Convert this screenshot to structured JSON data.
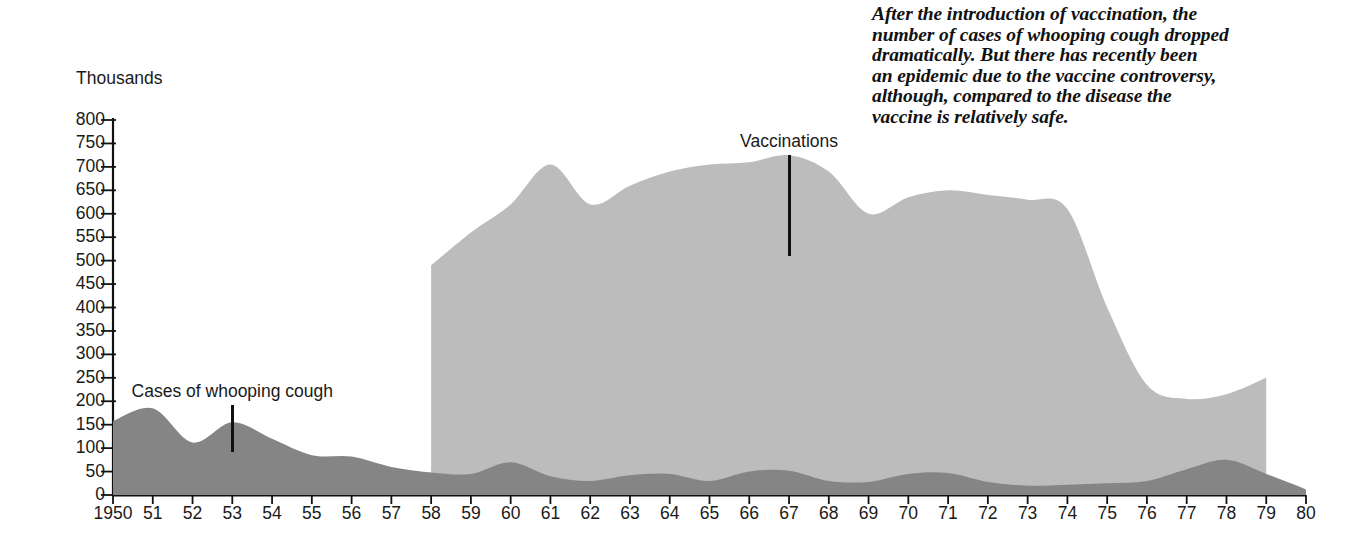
{
  "annotation": {
    "name": "editorial-note",
    "lines": [
      "After the introduction of vaccination, the",
      "number of cases of whooping cough dropped",
      "dramatically. But there has recently been",
      "an epidemic due to the vaccine controversy,",
      "although, compared to the disease the",
      "vaccine is relatively safe."
    ]
  },
  "colors": {
    "cases_fill": "#858585",
    "vaccinations_fill": "#bcbcbc",
    "axis": "#111111",
    "text": "#1a1a1a"
  },
  "chart_data": {
    "type": "area",
    "title": "",
    "subtitle": "",
    "xlabel": "",
    "ylabel": "Thousands",
    "grid": false,
    "legend_position": "inline-annotations",
    "xlim": [
      1950,
      1980
    ],
    "ylim": [
      0,
      800
    ],
    "ytick_step": 50,
    "x": [
      1950,
      1951,
      1952,
      1953,
      1954,
      1955,
      1956,
      1957,
      1958,
      1959,
      1960,
      1961,
      1962,
      1963,
      1964,
      1965,
      1966,
      1967,
      1968,
      1969,
      1970,
      1971,
      1972,
      1973,
      1974,
      1975,
      1976,
      1977,
      1978,
      1979,
      1980
    ],
    "xticklabels": [
      "1950",
      "51",
      "52",
      "53",
      "54",
      "55",
      "56",
      "57",
      "58",
      "59",
      "60",
      "61",
      "62",
      "63",
      "64",
      "65",
      "66",
      "67",
      "68",
      "69",
      "70",
      "71",
      "72",
      "73",
      "74",
      "75",
      "76",
      "77",
      "78",
      "79",
      "80"
    ],
    "yticklabels": [
      "800",
      "750",
      "700",
      "650",
      "600",
      "550",
      "500",
      "450",
      "400",
      "350",
      "300",
      "250",
      "200",
      "150",
      "100",
      "50",
      "0"
    ],
    "yticks": [
      800,
      750,
      700,
      650,
      600,
      550,
      500,
      450,
      400,
      350,
      300,
      250,
      200,
      150,
      100,
      50,
      0
    ],
    "series": [
      {
        "name": "Cases of whooping cough",
        "fill": "#858585",
        "label_x": 1953,
        "label_text": "Cases of whooping cough",
        "values": [
          158,
          185,
          112,
          155,
          120,
          85,
          82,
          60,
          48,
          45,
          70,
          40,
          30,
          42,
          45,
          30,
          50,
          52,
          30,
          28,
          45,
          47,
          28,
          20,
          22,
          25,
          30,
          55,
          75,
          45,
          12
        ]
      },
      {
        "name": "Vaccinations",
        "fill": "#bcbcbc",
        "label_x": 1967,
        "label_text": "Vaccinations",
        "start_year": 1958,
        "end_year": 1979,
        "values": [
          null,
          null,
          null,
          null,
          null,
          null,
          null,
          null,
          490,
          560,
          620,
          705,
          620,
          660,
          690,
          705,
          710,
          725,
          690,
          600,
          635,
          650,
          640,
          630,
          610,
          400,
          235,
          205,
          215,
          250,
          null
        ]
      }
    ],
    "annotations": [
      {
        "text": "Cases of whooping cough",
        "x": 1953,
        "leader_top": 405,
        "leader_bottom": 452
      },
      {
        "text": "Vaccinations",
        "x": 1967,
        "leader_top": 155,
        "leader_bottom": 256
      }
    ]
  }
}
